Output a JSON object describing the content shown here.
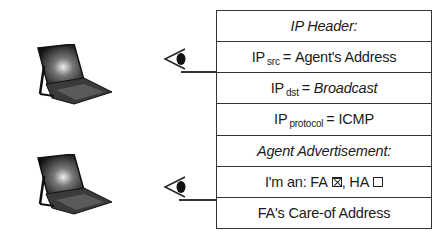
{
  "diagram": {
    "nodes": [
      {
        "id": "mobile-node-1",
        "type": "laptop"
      },
      {
        "id": "mobile-node-2",
        "type": "laptop"
      }
    ],
    "packet": {
      "rows": [
        {
          "label": "IP Header:",
          "style": "italic"
        },
        {
          "prefix": "IP",
          "sub": "src",
          "eq": "=",
          "value": "Agent's Address"
        },
        {
          "prefix": "IP",
          "sub": "dst",
          "eq": "=",
          "value": "Broadcast",
          "value_style": "italic"
        },
        {
          "prefix": "IP",
          "sub": "protocol",
          "eq": "=",
          "value": "ICMP"
        },
        {
          "label": "Agent Advertisement:",
          "style": "italic"
        },
        {
          "prefix": "I'm an: FA",
          "sep": ", HA",
          "fa_checked": true,
          "ha_checked": false
        },
        {
          "label": "FA's Care-of Address"
        }
      ]
    },
    "arrows": [
      {
        "from": "packet-row-ip-src",
        "to": "eye-1"
      },
      {
        "from": "packet-row-im-an",
        "to": "eye-2"
      }
    ]
  }
}
